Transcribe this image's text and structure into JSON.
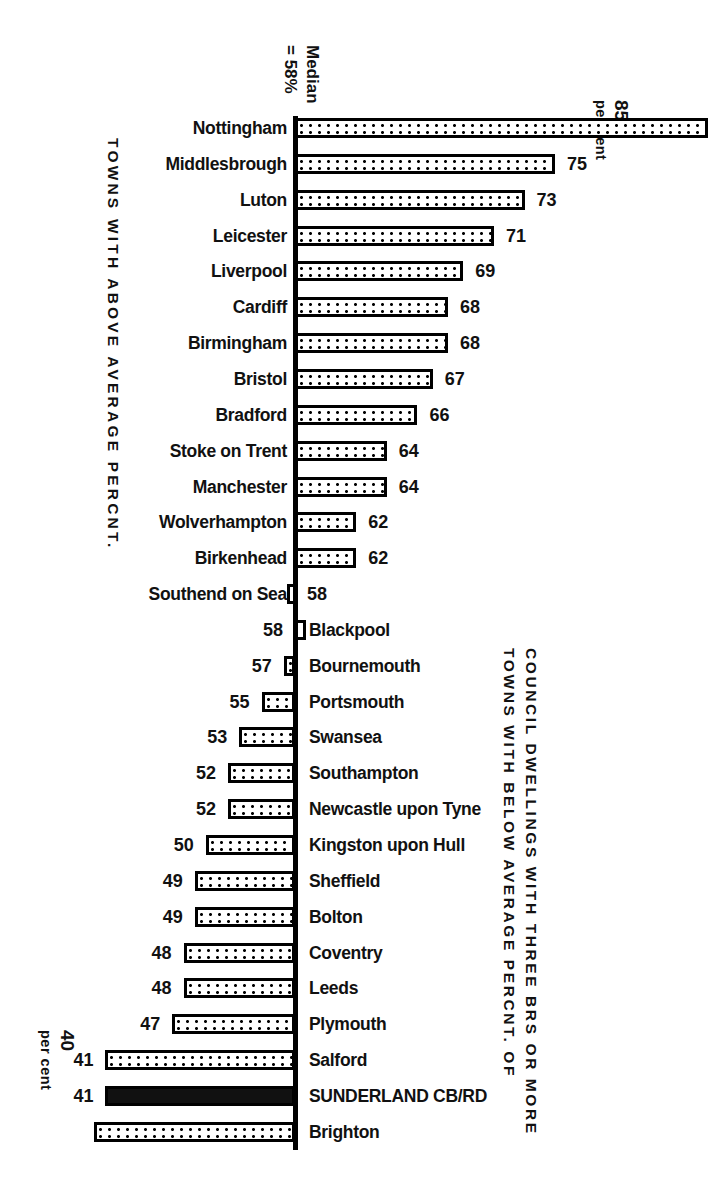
{
  "chart_data": {
    "type": "bar",
    "orientation": "horizontal",
    "subtype": "diverging-deviation-from-median",
    "title": "",
    "xlabel": "per cent",
    "ylabel": "",
    "median": 58,
    "median_label_line1": "Median",
    "median_label_line2": "= 58%",
    "axis_top_value": "85",
    "axis_top_unit": "per cent",
    "axis_bottom_value": "40",
    "axis_bottom_unit": "per cent",
    "group_above_label": "TOWNS WITH ABOVE AVERAGE PERCNT.",
    "group_below_label_outer": "TOWNS WITH BELOW AVERAGE PERCNT. OF",
    "group_below_label_inner": "COUNCIL DWELLINGS WITH THREE BRS OR MORE",
    "highlight_color": "#111111",
    "bar_fill_color": "#ffffff",
    "bar_border_color": "#000000",
    "categories": [
      "Nottingham",
      "Middlesbrough",
      "Luton",
      "Leicester",
      "Liverpool",
      "Cardiff",
      "Birmingham",
      "Bristol",
      "Bradford",
      "Stoke on Trent",
      "Manchester",
      "Wolverhampton",
      "Birkenhead",
      "Southend on Sea",
      "Blackpool",
      "Bournemouth",
      "Portsmouth",
      "Swansea",
      "Southampton",
      "Newcastle upon Tyne",
      "Kingston upon Hull",
      "Sheffield",
      "Bolton",
      "Coventry",
      "Leeds",
      "Plymouth",
      "Salford",
      "SUNDERLAND CB/RD",
      "Brighton"
    ],
    "values": [
      85,
      75,
      73,
      71,
      69,
      68,
      68,
      67,
      66,
      64,
      64,
      62,
      62,
      58,
      58,
      57,
      55,
      53,
      52,
      52,
      50,
      49,
      49,
      48,
      48,
      47,
      41,
      41,
      40
    ],
    "rows": [
      {
        "label": "Nottingham",
        "value": 85,
        "side": "above",
        "highlight": false
      },
      {
        "label": "Middlesbrough",
        "value": 75,
        "side": "above",
        "highlight": false
      },
      {
        "label": "Luton",
        "value": 73,
        "side": "above",
        "highlight": false
      },
      {
        "label": "Leicester",
        "value": 71,
        "side": "above",
        "highlight": false
      },
      {
        "label": "Liverpool",
        "value": 69,
        "side": "above",
        "highlight": false
      },
      {
        "label": "Cardiff",
        "value": 68,
        "side": "above",
        "highlight": false
      },
      {
        "label": "Birmingham",
        "value": 68,
        "side": "above",
        "highlight": false
      },
      {
        "label": "Bristol",
        "value": 67,
        "side": "above",
        "highlight": false
      },
      {
        "label": "Bradford",
        "value": 66,
        "side": "above",
        "highlight": false
      },
      {
        "label": "Stoke on Trent",
        "value": 64,
        "side": "above",
        "highlight": false
      },
      {
        "label": "Manchester",
        "value": 64,
        "side": "above",
        "highlight": false
      },
      {
        "label": "Wolverhampton",
        "value": 62,
        "side": "above",
        "highlight": false
      },
      {
        "label": "Birkenhead",
        "value": 62,
        "side": "above",
        "highlight": false
      },
      {
        "label": "Southend on Sea",
        "value": 58,
        "side": "above",
        "highlight": false
      },
      {
        "label": "Blackpool",
        "value": 58,
        "side": "below",
        "highlight": false
      },
      {
        "label": "Bournemouth",
        "value": 57,
        "side": "below",
        "highlight": false
      },
      {
        "label": "Portsmouth",
        "value": 55,
        "side": "below",
        "highlight": false
      },
      {
        "label": "Swansea",
        "value": 53,
        "side": "below",
        "highlight": false
      },
      {
        "label": "Southampton",
        "value": 52,
        "side": "below",
        "highlight": false
      },
      {
        "label": "Newcastle upon Tyne",
        "value": 52,
        "side": "below",
        "highlight": false
      },
      {
        "label": "Kingston upon Hull",
        "value": 50,
        "side": "below",
        "highlight": false
      },
      {
        "label": "Sheffield",
        "value": 49,
        "side": "below",
        "highlight": false
      },
      {
        "label": "Bolton",
        "value": 49,
        "side": "below",
        "highlight": false
      },
      {
        "label": "Coventry",
        "value": 48,
        "side": "below",
        "highlight": false
      },
      {
        "label": "Leeds",
        "value": 48,
        "side": "below",
        "highlight": false
      },
      {
        "label": "Plymouth",
        "value": 47,
        "side": "below",
        "highlight": false
      },
      {
        "label": "Salford",
        "value": 41,
        "side": "below",
        "highlight": false
      },
      {
        "label": "SUNDERLAND CB/RD",
        "value": 41,
        "side": "below",
        "highlight": true
      },
      {
        "label": "Brighton",
        "value": 40,
        "side": "below",
        "highlight": false
      }
    ]
  }
}
